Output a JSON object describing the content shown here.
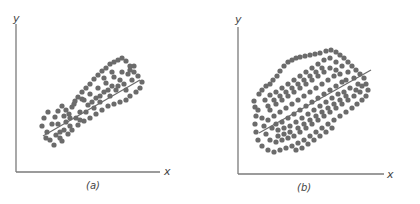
{
  "chart_data": [
    {
      "type": "scatter",
      "title": "",
      "caption": "(a)",
      "xlabel": "x",
      "ylabel": "y",
      "grid": false,
      "legend": "none",
      "regression_line": {
        "x1": 43,
        "y1": 136,
        "x2": 140,
        "y2": 80
      },
      "point_color": "#6b6b6b",
      "description": "Strong positive linear correlation; points tightly clustered in narrow band around fitted line",
      "points": [
        [
          44,
          118
        ],
        [
          48,
          112
        ],
        [
          42,
          126
        ],
        [
          47,
          132
        ],
        [
          52,
          124
        ],
        [
          55,
          117
        ],
        [
          58,
          111
        ],
        [
          62,
          106
        ],
        [
          50,
          140
        ],
        [
          54,
          145
        ],
        [
          60,
          138
        ],
        [
          64,
          130
        ],
        [
          66,
          122
        ],
        [
          69,
          114
        ],
        [
          72,
          107
        ],
        [
          75,
          101
        ],
        [
          78,
          97
        ],
        [
          82,
          92
        ],
        [
          86,
          88
        ],
        [
          90,
          84
        ],
        [
          94,
          79
        ],
        [
          98,
          75
        ],
        [
          102,
          71
        ],
        [
          106,
          68
        ],
        [
          110,
          64
        ],
        [
          114,
          62
        ],
        [
          118,
          60
        ],
        [
          122,
          58
        ],
        [
          126,
          61
        ],
        [
          130,
          66
        ],
        [
          134,
          72
        ],
        [
          138,
          76
        ],
        [
          142,
          82
        ],
        [
          140,
          88
        ],
        [
          136,
          92
        ],
        [
          130,
          96
        ],
        [
          126,
          100
        ],
        [
          120,
          102
        ],
        [
          114,
          104
        ],
        [
          108,
          106
        ],
        [
          102,
          110
        ],
        [
          96,
          114
        ],
        [
          90,
          118
        ],
        [
          84,
          121
        ],
        [
          78,
          125
        ],
        [
          72,
          130
        ],
        [
          68,
          134
        ],
        [
          62,
          141
        ],
        [
          56,
          135
        ],
        [
          46,
          138
        ],
        [
          58,
          124
        ],
        [
          70,
          118
        ],
        [
          80,
          112
        ],
        [
          88,
          105
        ],
        [
          96,
          98
        ],
        [
          104,
          92
        ],
        [
          112,
          86
        ],
        [
          120,
          80
        ],
        [
          128,
          74
        ],
        [
          134,
          66
        ],
        [
          76,
          118
        ],
        [
          86,
          112
        ],
        [
          94,
          108
        ],
        [
          100,
          102
        ],
        [
          110,
          96
        ],
        [
          116,
          90
        ],
        [
          124,
          84
        ],
        [
          132,
          80
        ],
        [
          66,
          110
        ],
        [
          74,
          104
        ],
        [
          82,
          99
        ],
        [
          90,
          94
        ],
        [
          98,
          88
        ],
        [
          106,
          83
        ],
        [
          114,
          77
        ],
        [
          122,
          72
        ],
        [
          130,
          70
        ],
        [
          64,
          116
        ],
        [
          60,
          132
        ],
        [
          70,
          126
        ],
        [
          80,
          120
        ],
        [
          92,
          102
        ],
        [
          100,
          96
        ],
        [
          108,
          90
        ],
        [
          118,
          86
        ],
        [
          126,
          90
        ],
        [
          84,
          100
        ],
        [
          104,
          78
        ],
        [
          112,
          72
        ]
      ]
    },
    {
      "type": "scatter",
      "title": "",
      "caption": "(b)",
      "xlabel": "x",
      "ylabel": "y",
      "grid": false,
      "legend": "none",
      "regression_line": {
        "x1": 259,
        "y1": 133,
        "x2": 371,
        "y2": 70
      },
      "point_color": "#6b6b6b",
      "description": "Weaker positive linear correlation; points widely scattered in broad elliptical cloud around fitted line",
      "points": [
        [
          254,
          101
        ],
        [
          255,
          107
        ],
        [
          259,
          94
        ],
        [
          262,
          90
        ],
        [
          266,
          86
        ],
        [
          270,
          84
        ],
        [
          273,
          80
        ],
        [
          277,
          76
        ],
        [
          280,
          71
        ],
        [
          284,
          66
        ],
        [
          288,
          62
        ],
        [
          292,
          60
        ],
        [
          296,
          58
        ],
        [
          300,
          57
        ],
        [
          305,
          56
        ],
        [
          310,
          55
        ],
        [
          315,
          54
        ],
        [
          320,
          53
        ],
        [
          326,
          51
        ],
        [
          331,
          50
        ],
        [
          336,
          52
        ],
        [
          340,
          55
        ],
        [
          344,
          58
        ],
        [
          348,
          62
        ],
        [
          352,
          66
        ],
        [
          356,
          70
        ],
        [
          360,
          74
        ],
        [
          364,
          78
        ],
        [
          366,
          84
        ],
        [
          368,
          90
        ],
        [
          366,
          96
        ],
        [
          362,
          100
        ],
        [
          357,
          104
        ],
        [
          352,
          108
        ],
        [
          346,
          112
        ],
        [
          340,
          116
        ],
        [
          334,
          120
        ],
        [
          328,
          124
        ],
        [
          322,
          128
        ],
        [
          316,
          132
        ],
        [
          310,
          136
        ],
        [
          304,
          140
        ],
        [
          298,
          143
        ],
        [
          292,
          146
        ],
        [
          286,
          148
        ],
        [
          280,
          150
        ],
        [
          274,
          152
        ],
        [
          268,
          150
        ],
        [
          262,
          146
        ],
        [
          258,
          140
        ],
        [
          256,
          132
        ],
        [
          255,
          124
        ],
        [
          256,
          116
        ],
        [
          258,
          110
        ],
        [
          265,
          100
        ],
        [
          270,
          95
        ],
        [
          276,
          92
        ],
        [
          282,
          88
        ],
        [
          288,
          84
        ],
        [
          294,
          80
        ],
        [
          300,
          76
        ],
        [
          306,
          72
        ],
        [
          312,
          68
        ],
        [
          318,
          64
        ],
        [
          324,
          60
        ],
        [
          330,
          58
        ],
        [
          336,
          62
        ],
        [
          342,
          66
        ],
        [
          348,
          72
        ],
        [
          354,
          78
        ],
        [
          358,
          84
        ],
        [
          360,
          92
        ],
        [
          354,
          96
        ],
        [
          348,
          100
        ],
        [
          342,
          104
        ],
        [
          336,
          108
        ],
        [
          330,
          112
        ],
        [
          324,
          116
        ],
        [
          318,
          120
        ],
        [
          312,
          124
        ],
        [
          306,
          128
        ],
        [
          300,
          132
        ],
        [
          294,
          136
        ],
        [
          288,
          138
        ],
        [
          282,
          140
        ],
        [
          276,
          142
        ],
        [
          270,
          140
        ],
        [
          266,
          134
        ],
        [
          264,
          126
        ],
        [
          268,
          120
        ],
        [
          274,
          116
        ],
        [
          280,
          112
        ],
        [
          286,
          108
        ],
        [
          292,
          104
        ],
        [
          298,
          100
        ],
        [
          304,
          96
        ],
        [
          310,
          92
        ],
        [
          316,
          88
        ],
        [
          322,
          84
        ],
        [
          328,
          80
        ],
        [
          334,
          76
        ],
        [
          340,
          74
        ],
        [
          346,
          80
        ],
        [
          350,
          88
        ],
        [
          344,
          92
        ],
        [
          338,
          94
        ],
        [
          332,
          98
        ],
        [
          326,
          102
        ],
        [
          320,
          106
        ],
        [
          314,
          110
        ],
        [
          308,
          114
        ],
        [
          302,
          118
        ],
        [
          296,
          122
        ],
        [
          290,
          126
        ],
        [
          284,
          128
        ],
        [
          278,
          130
        ],
        [
          272,
          128
        ],
        [
          270,
          110
        ],
        [
          276,
          104
        ],
        [
          282,
          100
        ],
        [
          288,
          96
        ],
        [
          294,
          92
        ],
        [
          300,
          88
        ],
        [
          306,
          84
        ],
        [
          312,
          80
        ],
        [
          318,
          76
        ],
        [
          324,
          72
        ],
        [
          330,
          68
        ],
        [
          336,
          70
        ],
        [
          342,
          82
        ],
        [
          336,
          86
        ],
        [
          330,
          90
        ],
        [
          324,
          94
        ],
        [
          318,
          98
        ],
        [
          312,
          102
        ],
        [
          306,
          106
        ],
        [
          300,
          110
        ],
        [
          294,
          114
        ],
        [
          288,
          118
        ],
        [
          282,
          122
        ],
        [
          276,
          124
        ],
        [
          262,
          118
        ],
        [
          268,
          106
        ],
        [
          274,
          100
        ],
        [
          280,
          96
        ],
        [
          286,
          92
        ],
        [
          292,
          88
        ],
        [
          298,
          84
        ],
        [
          304,
          80
        ],
        [
          310,
          76
        ],
        [
          316,
          72
        ],
        [
          322,
          68
        ],
        [
          356,
          90
        ],
        [
          362,
          86
        ],
        [
          346,
          96
        ],
        [
          340,
          100
        ],
        [
          334,
          104
        ],
        [
          328,
          108
        ],
        [
          322,
          112
        ],
        [
          316,
          116
        ],
        [
          310,
          120
        ],
        [
          304,
          124
        ],
        [
          298,
          128
        ],
        [
          290,
          132
        ],
        [
          284,
          134
        ],
        [
          278,
          136
        ],
        [
          296,
          150
        ],
        [
          302,
          148
        ],
        [
          308,
          144
        ],
        [
          314,
          140
        ],
        [
          320,
          136
        ],
        [
          326,
          132
        ],
        [
          332,
          128
        ]
      ]
    }
  ],
  "labels": {
    "panel_a": {
      "y_axis": "y",
      "x_axis": "x",
      "caption": "(a)"
    },
    "panel_b": {
      "y_axis": "y",
      "x_axis": "x",
      "caption": "(b)"
    }
  },
  "colors": {
    "axis": "#7a7a7a",
    "point": "#6b6b6b",
    "line": "#6b6b6b",
    "text": "#444444"
  }
}
